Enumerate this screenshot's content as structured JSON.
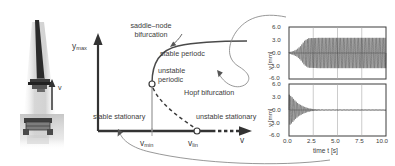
{
  "figure": {
    "type": "bifurcation-diagram-with-time-series",
    "background": "#ffffff",
    "ink_color": "#3c3c3c"
  },
  "photo": {
    "alt_name": "milling-machine-photograph",
    "velocity_arrow_label": "v",
    "description": "grayscale photograph of a slender milling tool on a machine bed with upward velocity arrow"
  },
  "bifurcation": {
    "y_axis_label": "y",
    "y_axis_label_sub": "max",
    "x_axis_label": "v",
    "labels": {
      "saddle_node_line1": "saddle–node",
      "saddle_node_line2": "bifurcation",
      "stable_periodic": "stable periodc",
      "unstable_periodic_line1": "unstable",
      "unstable_periodic_line2": "periodic",
      "hopf": "Hopf bifurcation",
      "stable_stationary": "stable stationary",
      "unstable_stationary": "unstable stationary"
    },
    "tick_labels": [
      {
        "base": "v",
        "sub": "min"
      },
      {
        "base": "v",
        "sub": "lin"
      }
    ],
    "branches": [
      {
        "name": "stable-stationary-branch",
        "style": "solid-thick",
        "from_v": 0.0,
        "to_v": 0.62
      },
      {
        "name": "unstable-stationary-branch",
        "style": "dashed-thick",
        "from_v": 0.62,
        "to_v": 1.0
      },
      {
        "name": "unstable-periodic-branch",
        "style": "dashed-thin",
        "from_v": 0.36,
        "to_v": 0.62
      },
      {
        "name": "stable-periodic-branch",
        "style": "solid-thin",
        "from_v": 0.36,
        "to_v": 1.0
      },
      {
        "name": "saddle-node-vertical-segment",
        "style": "solid-thin",
        "at_v": 0.36
      }
    ],
    "markers": [
      {
        "name": "saddle-node-point",
        "shape": "open-circle"
      },
      {
        "name": "hopf-point",
        "shape": "open-circle"
      }
    ]
  },
  "chart_data": [
    {
      "type": "line",
      "name": "upper-time-series-stable-periodic",
      "title": "",
      "xlabel": "time t  [s]",
      "ylabel": "y [mm]",
      "xlim": [
        0.0,
        10.0
      ],
      "ylim": [
        -6.0,
        6.0
      ],
      "xticks": [
        "0.0",
        "2.5",
        "5.0",
        "7.5",
        "10.0"
      ],
      "yticks": [
        "6.0",
        "3.0",
        "0.0",
        "-3.0",
        "-6.0"
      ],
      "grid": true,
      "legend": "none",
      "annotation": "growing oscillation saturating to a large stable limit cycle of ~±3.5 mm",
      "envelope": [
        {
          "t": 0.0,
          "amp": 0.15
        },
        {
          "t": 0.4,
          "amp": 0.4
        },
        {
          "t": 0.8,
          "amp": 0.8
        },
        {
          "t": 1.2,
          "amp": 1.6
        },
        {
          "t": 1.6,
          "amp": 2.8
        },
        {
          "t": 2.0,
          "amp": 3.4
        },
        {
          "t": 3.0,
          "amp": 3.5
        },
        {
          "t": 5.0,
          "amp": 3.5
        },
        {
          "t": 7.5,
          "amp": 3.5
        },
        {
          "t": 10.0,
          "amp": 3.5
        }
      ],
      "frequency_hz": 7.0
    },
    {
      "type": "line",
      "name": "lower-time-series-stable-stationary",
      "title": "",
      "xlabel": "time t  [s]",
      "ylabel": "y [mm]",
      "xlim": [
        0.0,
        10.0
      ],
      "ylim": [
        -6.0,
        6.0
      ],
      "xticks": [
        "0.0",
        "2.5",
        "5.0",
        "7.5",
        "10.0"
      ],
      "yticks": [
        "6.0",
        "3.0",
        "0.0",
        "-3.0",
        "-6.0"
      ],
      "grid": true,
      "legend": "none",
      "annotation": "decaying oscillation settling to the stationary solution y = 0",
      "envelope": [
        {
          "t": 0.0,
          "amp": 3.6
        },
        {
          "t": 0.3,
          "amp": 3.0
        },
        {
          "t": 0.6,
          "amp": 2.2
        },
        {
          "t": 1.0,
          "amp": 1.4
        },
        {
          "t": 1.5,
          "amp": 0.8
        },
        {
          "t": 2.0,
          "amp": 0.4
        },
        {
          "t": 2.6,
          "amp": 0.15
        },
        {
          "t": 3.4,
          "amp": 0.05
        },
        {
          "t": 10.0,
          "amp": 0.0
        }
      ],
      "frequency_hz": 7.0
    }
  ],
  "connectors": [
    {
      "name": "upper-callout-curve",
      "from": "upper-plot-left",
      "to": "stable-periodic-branch"
    },
    {
      "name": "lower-callout-curve",
      "from": "lower-plot-bottom",
      "to": "v-min-axis-point"
    }
  ]
}
